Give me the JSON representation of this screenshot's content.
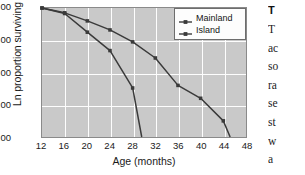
{
  "figure": {
    "plot_background": "#c9c9c9",
    "gridline_color": "#fdfdfd",
    "line_color": "#3a3a3a"
  },
  "chart_data": {
    "type": "line",
    "title": "",
    "xlabel": "Age (months)",
    "ylabel": "Ln proportion surviving",
    "xlim": [
      12,
      48
    ],
    "ylim": [
      -4.0,
      0.0
    ],
    "xticks": [
      12,
      16,
      20,
      24,
      28,
      32,
      36,
      40,
      44,
      48
    ],
    "xtick_labels": [
      "12",
      "16",
      "20",
      "24",
      "28",
      "32",
      "36",
      "40",
      "44",
      "48"
    ],
    "yticks": [
      0.0,
      -1.0,
      -2.0,
      -3.0,
      -4.0
    ],
    "ytick_labels": [
      "0.00",
      "-1.00",
      "-2.00",
      "-3.00",
      "-4.00"
    ],
    "grid": true,
    "legend_position": "upper right",
    "marker": "square",
    "series": [
      {
        "name": "Mainland",
        "x": [
          12,
          16,
          20,
          24,
          28,
          32,
          36,
          40,
          44,
          45.2
        ],
        "y": [
          0.0,
          -0.15,
          -0.4,
          -0.68,
          -1.05,
          -1.55,
          -2.4,
          -2.8,
          -3.5,
          -4.0
        ]
      },
      {
        "name": "Island",
        "x": [
          12,
          16,
          20,
          24,
          28,
          29.6
        ],
        "y": [
          0.0,
          -0.17,
          -0.75,
          -1.32,
          -2.48,
          -4.0
        ]
      }
    ]
  },
  "legend": {
    "items": [
      {
        "label": "Mainland"
      },
      {
        "label": "Island"
      }
    ]
  },
  "text_column": {
    "heading": "T",
    "lines": [
      "T",
      "ac",
      "so",
      "ra",
      "se",
      "st",
      "w",
      "a"
    ]
  }
}
